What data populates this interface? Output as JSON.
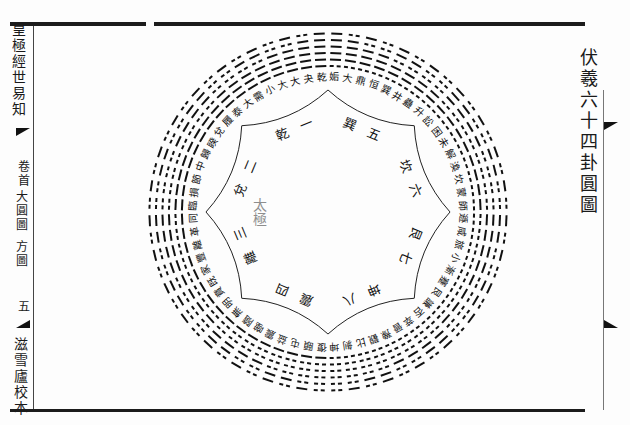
{
  "page": {
    "title": "伏羲六十四卦圓圖",
    "spine": {
      "book_title": "皇極經世易知",
      "volume": "卷首",
      "section_top": "大圓圖",
      "section_bottom": "方圖",
      "page_number": "五",
      "publisher": "滋雪廬校本"
    }
  },
  "diagram": {
    "type": "hexagram-circle",
    "center": [
      328,
      212
    ],
    "ring_inner_radius": 128,
    "ring_outer_radius": 185,
    "hexagrams": [
      "乾",
      "夬",
      "大有",
      "大壯",
      "小畜",
      "需",
      "大畜",
      "泰",
      "履",
      "兌",
      "睽",
      "歸妹",
      "中孚",
      "節",
      "損",
      "臨",
      "同人",
      "革",
      "離",
      "豐",
      "家人",
      "既濟",
      "賁",
      "明夷",
      "無妄",
      "隨",
      "噬嗑",
      "震",
      "益",
      "屯",
      "頤",
      "復",
      "姤",
      "大過",
      "鼎",
      "恒",
      "巽",
      "井",
      "蠱",
      "升",
      "訟",
      "困",
      "未濟",
      "解",
      "渙",
      "坎",
      "蒙",
      "師",
      "遯",
      "咸",
      "旅",
      "小過",
      "漸",
      "蹇",
      "艮",
      "謙",
      "否",
      "萃",
      "晉",
      "豫",
      "觀",
      "比",
      "剝",
      "坤"
    ],
    "trigram_sectors": [
      {
        "name": "乾",
        "number": "一"
      },
      {
        "name": "兌",
        "number": "二"
      },
      {
        "name": "離",
        "number": "三"
      },
      {
        "name": "震",
        "number": "四"
      },
      {
        "name": "巽",
        "number": "五"
      },
      {
        "name": "坎",
        "number": "六"
      },
      {
        "name": "艮",
        "number": "七"
      },
      {
        "name": "坤",
        "number": "八"
      }
    ],
    "center_mark": "太極"
  }
}
